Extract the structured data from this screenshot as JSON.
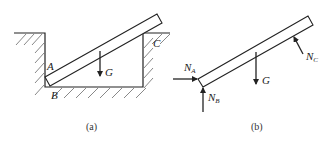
{
  "figure_a": {
    "caption": "(a)",
    "labels": {
      "A": "A",
      "B": "B",
      "C": "C",
      "G": "G"
    },
    "description": "Uniform rod resting in a rectangular trench: lower end touches left wall at A and floor at B, rod rests on top-right corner C"
  },
  "figure_b": {
    "caption": "(b)",
    "forces": [
      {
        "name": "N",
        "sub": "A",
        "direction": "horizontal-right"
      },
      {
        "name": "N",
        "sub": "B",
        "direction": "vertical-up"
      },
      {
        "name": "G",
        "sub": "",
        "direction": "vertical-down"
      },
      {
        "name": "N",
        "sub": "C",
        "direction": "perpendicular-to-rod"
      }
    ],
    "description": "Free body diagram of the rod"
  },
  "colors": {
    "line": "#222222",
    "hatch": "#555555",
    "background": "#ffffff"
  }
}
